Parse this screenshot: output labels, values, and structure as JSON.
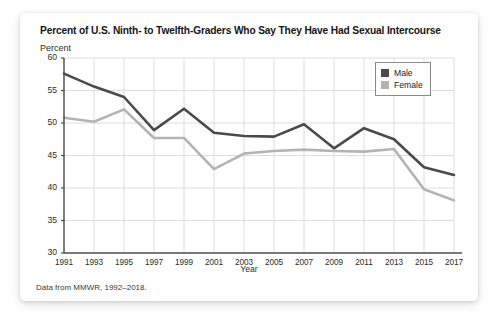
{
  "card": {
    "footnote": "Data from MMWR, 1992–2018."
  },
  "legend": {
    "position": "top-right",
    "entries": [
      {
        "label": "Male",
        "color": "#4a4a4a"
      },
      {
        "label": "Female",
        "color": "#b3b3b3"
      }
    ]
  },
  "chart_data": {
    "type": "line",
    "title": "Percent of U.S. Ninth- to Twelfth-Graders Who Say They Have Had Sexual Intercourse",
    "subtitle": "Percent",
    "xlabel": "Year",
    "ylabel": "Percent",
    "grid": true,
    "xlim": [
      1991,
      2017
    ],
    "ylim": [
      30,
      60
    ],
    "ytick_step": 5,
    "yticks": [
      30,
      35,
      40,
      45,
      50,
      55,
      60
    ],
    "categories": [
      1991,
      1993,
      1995,
      1997,
      1999,
      2001,
      2003,
      2005,
      2007,
      2009,
      2011,
      2013,
      2015,
      2017
    ],
    "xticks": [
      "1991",
      "1993",
      "1995",
      "1997",
      "1999",
      "2001",
      "2003",
      "2005",
      "2007",
      "2009",
      "2011",
      "2013",
      "2015",
      "2017"
    ],
    "series": [
      {
        "name": "Male",
        "color": "#4a4a4a",
        "values": [
          57.6,
          55.6,
          54.0,
          48.9,
          52.2,
          48.5,
          48.0,
          47.9,
          49.8,
          46.1,
          49.2,
          47.5,
          43.2,
          42.0
        ]
      },
      {
        "name": "Female",
        "color": "#b3b3b3",
        "values": [
          50.8,
          50.2,
          52.1,
          47.7,
          47.7,
          42.9,
          45.3,
          45.7,
          45.9,
          45.7,
          45.6,
          46.0,
          39.8,
          38.1
        ]
      }
    ],
    "colors": {
      "axis": "#4d4d4d",
      "grid": "#dcdcdc",
      "text": "#2b2b2b"
    }
  }
}
